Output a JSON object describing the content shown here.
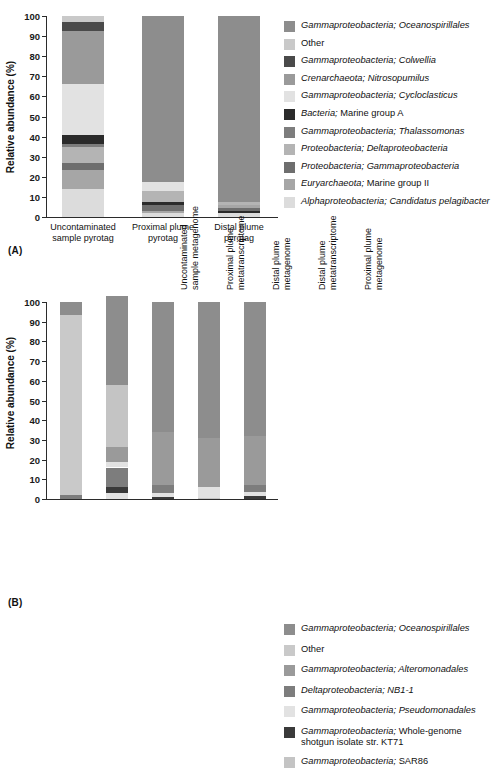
{
  "figure": {
    "panel_a_tag": "(A)",
    "panel_b_tag": "(B)",
    "y_axis_title": "Relative abundance (%)",
    "y_ticks": [
      "100",
      "90",
      "80",
      "70",
      "60",
      "50",
      "40",
      "30",
      "20",
      "10",
      "0"
    ]
  },
  "palette": {
    "oceanospirillales": "#8d8d8d",
    "other": "#c9c9c9",
    "colwellia": "#4a4a4a",
    "nitrosopumilus": "#9a9a9a",
    "cycloclasticus": "#e2e2e2",
    "marine_group_a": "#2b2b2b",
    "thalassomonas": "#7d7d7d",
    "deltaproteobacteria": "#b4b4b4",
    "gammaproteobacteria": "#6e6e6e",
    "marine_group_ii": "#a6a6a6",
    "candidatus_pelagibacter": "#dcdcdc",
    "alteromonadales": "#9a9a9a",
    "nb1_1": "#7d7d7d",
    "pseudomonadales": "#e2e2e2",
    "kt71": "#3a3a3a",
    "sar86": "#c4c4c4"
  },
  "legend_a": [
    {
      "genus": "Gammaproteobacteria; ",
      "taxon": "Oceanospirillales",
      "italic_all": true,
      "color_key": "oceanospirillales",
      "label": "Gammaproteobacteria; Oceanospirillales"
    },
    {
      "genus": "",
      "taxon": "Other",
      "italic_all": false,
      "color_key": "other",
      "label": "Other"
    },
    {
      "genus": "Gammaproteobacteria; ",
      "taxon": "Colwellia",
      "italic_all": true,
      "color_key": "colwellia",
      "label": "Gammaproteobacteria; Colwellia"
    },
    {
      "genus": "Crenarchaeota; ",
      "taxon": "Nitrosopumilus",
      "italic_all": true,
      "color_key": "nitrosopumilus",
      "label": "Crenarchaeota; Nitrosopumilus"
    },
    {
      "genus": "Gammaproteobacteria; ",
      "taxon": "Cycloclasticus",
      "italic_all": true,
      "color_key": "cycloclasticus",
      "label": "Gammaproteobacteria; Cycloclasticus"
    },
    {
      "genus": "Bacteria; ",
      "taxon": "Marine group A",
      "italic_all": false,
      "color_key": "marine_group_a",
      "label": "Bacteria; Marine group A"
    },
    {
      "genus": "Gammaproteobacteria; ",
      "taxon": "Thalassomonas",
      "italic_all": true,
      "color_key": "thalassomonas",
      "label": "Gammaproteobacteria; Thalassomonas"
    },
    {
      "genus": "Proteobacteria; ",
      "taxon": "Deltaproteobacteria",
      "italic_all": true,
      "color_key": "deltaproteobacteria",
      "label": "Proteobacteria; Deltaproteobacteria"
    },
    {
      "genus": "Proteobacteria; ",
      "taxon": "Gammaproteobacteria",
      "italic_all": true,
      "color_key": "gammaproteobacteria",
      "label": "Proteobacteria; Gammaproteobacteria"
    },
    {
      "genus": "Euryarchaeota; ",
      "taxon": "Marine group II",
      "italic_all": false,
      "color_key": "marine_group_ii",
      "label": "Euryarchaeota; Marine group II"
    },
    {
      "genus": "Alphaproteobacteria; ",
      "taxon": "Candidatus pelagibacter",
      "italic_all": true,
      "color_key": "candidatus_pelagibacter",
      "label": "Alphaproteobacteria; Candidatus pelagibacter"
    }
  ],
  "legend_b": [
    {
      "genus": "Gammaproteobacteria; ",
      "taxon": "Oceanospirillales",
      "italic_all": true,
      "color_key": "oceanospirillales",
      "label": "Gammaproteobacteria; Oceanospirillales"
    },
    {
      "genus": "",
      "taxon": "Other",
      "italic_all": false,
      "color_key": "other",
      "label": "Other"
    },
    {
      "genus": "Gammaproteobacteria; ",
      "taxon": "Alteromonadales",
      "italic_all": true,
      "color_key": "alteromonadales",
      "label": "Gammaproteobacteria; Alteromonadales"
    },
    {
      "genus": "Deltaproteobacteria; ",
      "taxon": "NB1-1",
      "italic_all": true,
      "color_key": "nb1_1",
      "label": "Deltaproteobacteria; NB1-1"
    },
    {
      "genus": "Gammaproteobacteria; ",
      "taxon": "Pseudomonadales",
      "italic_all": true,
      "color_key": "pseudomonadales",
      "label": "Gammaproteobacteria; Pseudomonadales"
    },
    {
      "genus": "Gammaproteobacteria; ",
      "taxon": "Whole-genome\nshotgun isolate str. KT71",
      "italic_all": false,
      "color_key": "kt71",
      "label": "Gammaproteobacteria; Whole-genome\nshotgun isolate str. KT71"
    },
    {
      "genus": "Gammaproteobacteria; ",
      "taxon": "SAR86",
      "italic_all": false,
      "color_key": "sar86",
      "label": "Gammaproteobacteria; SAR86"
    }
  ],
  "chart_data": [
    {
      "type": "bar",
      "stacked": true,
      "panel": "(A)",
      "title": "",
      "xlabel": "",
      "ylabel": "Relative abundance (%)",
      "ylim": [
        0,
        100
      ],
      "grid": false,
      "legend_position": "right",
      "categories": [
        "Uncontaminated\nsample pyrotag",
        "Proximal plume\npyrotag",
        "Distal plume\npyrotag"
      ],
      "series": [
        {
          "name": "Gammaproteobacteria; Oceanospirillales",
          "color_key": "oceanospirillales",
          "values": [
            0.0,
            82.5,
            92.5
          ]
        },
        {
          "name": "Other",
          "color_key": "other",
          "values": [
            3.0,
            0.0,
            0.0
          ]
        },
        {
          "name": "Gammaproteobacteria; Colwellia",
          "color_key": "colwellia",
          "values": [
            4.5,
            0.0,
            0.0
          ]
        },
        {
          "name": "Crenarchaeota; Nitrosopumilus",
          "color_key": "nitrosopumilus",
          "values": [
            26.5,
            0.0,
            0.0
          ]
        },
        {
          "name": "Gammaproteobacteria; Cycloclasticus",
          "color_key": "cycloclasticus",
          "values": [
            25.0,
            4.5,
            0.0
          ]
        },
        {
          "name": "Bacteria; Marine group A",
          "color_key": "marine_group_a",
          "values": [
            4.5,
            1.5,
            1.0
          ]
        },
        {
          "name": "Gammaproteobacteria; Thalassomonas",
          "color_key": "thalassomonas",
          "values": [
            1.5,
            0.0,
            0.0
          ]
        },
        {
          "name": "Proteobacteria; Deltaproteobacteria",
          "color_key": "deltaproteobacteria",
          "values": [
            8.0,
            5.5,
            1.5
          ]
        },
        {
          "name": "Proteobacteria; Gammaproteobacteria",
          "color_key": "gammaproteobacteria",
          "values": [
            3.5,
            3.0,
            1.5
          ]
        },
        {
          "name": "Euryarchaeota; Marine group II",
          "color_key": "marine_group_ii",
          "values": [
            9.5,
            1.0,
            1.5
          ]
        },
        {
          "name": "Alphaproteobacteria; Candidatus pelagibacter",
          "color_key": "candidatus_pelagibacter",
          "values": [
            14.0,
            2.0,
            2.0
          ]
        }
      ],
      "stack_order_bottom_up": [
        [
          "Alphaproteobacteria; Candidatus pelagibacter",
          "Euryarchaeota; Marine group II",
          "Proteobacteria; Gammaproteobacteria",
          "Proteobacteria; Deltaproteobacteria",
          "Gammaproteobacteria; Thalassomonas",
          "Bacteria; Marine group A",
          "Gammaproteobacteria; Cycloclasticus",
          "Crenarchaeota; Nitrosopumilus",
          "Gammaproteobacteria; Colwellia",
          "Other"
        ],
        [
          "Alphaproteobacteria; Candidatus pelagibacter",
          "Euryarchaeota; Marine group II",
          "Proteobacteria; Gammaproteobacteria",
          "Bacteria; Marine group A",
          "Proteobacteria; Deltaproteobacteria",
          "Gammaproteobacteria; Cycloclasticus",
          "Gammaproteobacteria; Oceanospirillales"
        ],
        [
          "Alphaproteobacteria; Candidatus pelagibacter",
          "Bacteria; Marine group A",
          "Proteobacteria; Gammaproteobacteria",
          "Euryarchaeota; Marine group II",
          "Proteobacteria; Deltaproteobacteria",
          "Gammaproteobacteria; Oceanospirillales"
        ]
      ]
    },
    {
      "type": "bar",
      "stacked": true,
      "panel": "(B)",
      "title": "",
      "xlabel": "",
      "ylabel": "Relative abundance (%)",
      "ylim": [
        0,
        100
      ],
      "grid": false,
      "legend_position": "right",
      "categories": [
        "Uncontaminated\nsample metagenome",
        "Proximal plume\nmetatranscriptome",
        "Distal plume\nmetagenome",
        "Distal plume\nmetatranscriptome",
        "Proximal plume\nmetagenome"
      ],
      "series": [
        {
          "name": "Gammaproteobacteria; Oceanospirillales",
          "color_key": "oceanospirillales",
          "values": [
            6.5,
            45.0,
            66.0,
            69.0,
            68.0
          ]
        },
        {
          "name": "Other",
          "color_key": "other",
          "values": [
            91.5,
            0.0,
            0.0,
            0.0,
            0.0
          ]
        },
        {
          "name": "Gammaproteobacteria; Alteromonadales",
          "color_key": "alteromonadales",
          "values": [
            0.0,
            7.5,
            27.0,
            25.0,
            25.0
          ]
        },
        {
          "name": "Deltaproteobacteria; NB1-1",
          "color_key": "nb1_1",
          "values": [
            2.0,
            10.0,
            4.0,
            0.0,
            3.5
          ]
        },
        {
          "name": "Gammaproteobacteria; Pseudomonadales",
          "color_key": "pseudomonadales",
          "values": [
            0.0,
            3.0,
            2.0,
            5.5,
            2.0
          ]
        },
        {
          "name": "Gammaproteobacteria; Whole-genome shotgun isolate str. KT71",
          "color_key": "kt71",
          "values": [
            0.0,
            3.0,
            1.0,
            0.0,
            1.5
          ]
        },
        {
          "name": "Gammaproteobacteria; SAR86",
          "color_key": "sar86",
          "values": [
            0.0,
            31.5,
            0.0,
            0.5,
            0.0
          ]
        }
      ],
      "stack_order_bottom_up": [
        [
          "Deltaproteobacteria; NB1-1",
          "Other",
          "Gammaproteobacteria; Oceanospirillales"
        ],
        [
          "Gammaproteobacteria; Pseudomonadales",
          "Gammaproteobacteria; Whole-genome shotgun isolate str. KT71",
          "Deltaproteobacteria; NB1-1",
          "Gammaproteobacteria; Pseudomonadales",
          "Gammaproteobacteria; Alteromonadales",
          "Gammaproteobacteria; SAR86",
          "Gammaproteobacteria; Oceanospirillales"
        ],
        [
          "Gammaproteobacteria; Whole-genome shotgun isolate str. KT71",
          "Gammaproteobacteria; Pseudomonadales",
          "Deltaproteobacteria; NB1-1",
          "Gammaproteobacteria; Alteromonadales",
          "Gammaproteobacteria; Oceanospirillales"
        ],
        [
          "Gammaproteobacteria; SAR86",
          "Gammaproteobacteria; Pseudomonadales",
          "Gammaproteobacteria; Alteromonadales",
          "Gammaproteobacteria; Oceanospirillales"
        ],
        [
          "Gammaproteobacteria; Whole-genome shotgun isolate str. KT71",
          "Gammaproteobacteria; Pseudomonadales",
          "Deltaproteobacteria; NB1-1",
          "Gammaproteobacteria; Alteromonadales",
          "Gammaproteobacteria; Oceanospirillales"
        ]
      ]
    }
  ]
}
